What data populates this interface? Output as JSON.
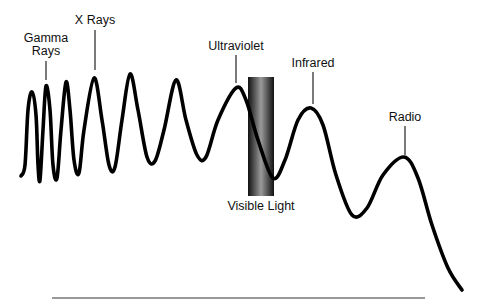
{
  "diagram": {
    "title": "",
    "type": "electromagnetic-spectrum-wave",
    "colors": {
      "wave": "#000000",
      "band_dark": "#1a1a1a",
      "band_light": "#9a9a9a",
      "text": "#111111",
      "baseline": "#333333"
    },
    "labels": [
      {
        "id": "gamma",
        "text": "Gamma\nRays",
        "x": 46,
        "y": 32,
        "pointer": [
          46,
          61,
          46,
          80
        ]
      },
      {
        "id": "xrays",
        "text": "X Rays",
        "x": 95,
        "y": 14,
        "pointer": [
          95,
          30,
          95,
          70
        ]
      },
      {
        "id": "ultraviolet",
        "text": "Ultraviolet",
        "x": 236,
        "y": 40,
        "pointer": [
          236,
          55,
          236,
          83
        ]
      },
      {
        "id": "infrared",
        "text": "Infrared",
        "x": 313,
        "y": 57,
        "pointer": [
          313,
          72,
          313,
          104
        ]
      },
      {
        "id": "radio",
        "text": "Radio",
        "x": 405,
        "y": 111,
        "pointer": [
          405,
          126,
          405,
          155
        ]
      },
      {
        "id": "visible",
        "text": "Visible Light",
        "x": 261,
        "y": 200,
        "pointer": null
      }
    ],
    "visible_band": {
      "x": 248,
      "y": 77,
      "width": 26,
      "height": 119
    },
    "baseline": {
      "x1": 52,
      "y1": 298,
      "x2": 425,
      "y2": 298
    },
    "wave_points": [
      [
        21,
        176
      ],
      [
        25,
        165
      ],
      [
        28,
        110
      ],
      [
        32,
        92
      ],
      [
        36,
        115
      ],
      [
        38,
        165
      ],
      [
        40,
        180
      ],
      [
        43,
        130
      ],
      [
        46,
        86
      ],
      [
        50,
        110
      ],
      [
        53,
        165
      ],
      [
        57,
        178
      ],
      [
        61,
        130
      ],
      [
        66,
        82
      ],
      [
        70,
        110
      ],
      [
        74,
        160
      ],
      [
        79,
        173
      ],
      [
        84,
        130
      ],
      [
        94,
        78
      ],
      [
        102,
        120
      ],
      [
        109,
        165
      ],
      [
        115,
        167
      ],
      [
        122,
        120
      ],
      [
        130,
        74
      ],
      [
        138,
        110
      ],
      [
        147,
        157
      ],
      [
        155,
        161
      ],
      [
        164,
        130
      ],
      [
        176,
        80
      ],
      [
        186,
        120
      ],
      [
        197,
        155
      ],
      [
        206,
        157
      ],
      [
        218,
        120
      ],
      [
        236,
        88
      ],
      [
        246,
        100
      ],
      [
        258,
        140
      ],
      [
        273,
        178
      ],
      [
        285,
        160
      ],
      [
        298,
        120
      ],
      [
        311,
        108
      ],
      [
        323,
        125
      ],
      [
        336,
        175
      ],
      [
        352,
        215
      ],
      [
        367,
        208
      ],
      [
        383,
        175
      ],
      [
        404,
        157
      ],
      [
        418,
        178
      ],
      [
        432,
        225
      ],
      [
        448,
        268
      ],
      [
        462,
        290
      ]
    ]
  }
}
